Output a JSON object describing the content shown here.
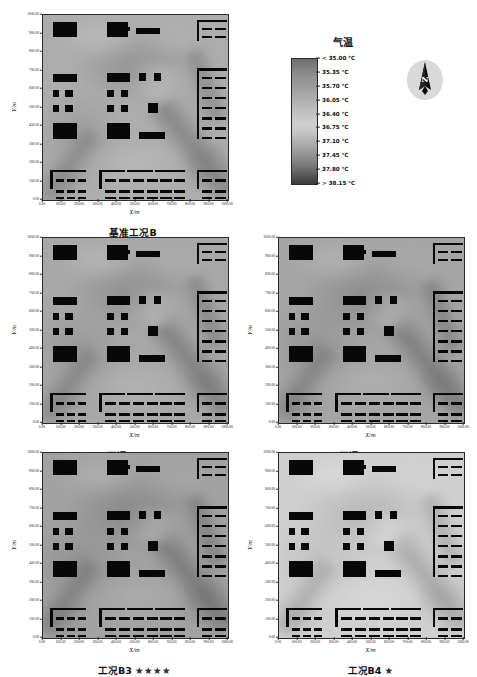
{
  "figure": {
    "axis_x_title": "X/m",
    "axis_y_title": "Y/m",
    "x_ticks": [
      "0.00",
      "100.00",
      "200.00",
      "300.00",
      "400.00",
      "500.00",
      "600.00",
      "700.00",
      "800.00",
      "900.00",
      "1000.00"
    ],
    "y_ticks": [
      "0.00",
      "100.00",
      "200.00",
      "300.00",
      "400.00",
      "500.00",
      "600.00",
      "700.00",
      "800.00",
      "900.00",
      "1000.00"
    ]
  },
  "colorbar": {
    "title": "气温",
    "unit": "℃",
    "labels": [
      "< 35.00 ℃",
      "35.35 ℃",
      "35.70 ℃",
      "36.05 ℃",
      "36.40 ℃",
      "36.75 ℃",
      "37.10 ℃",
      "37.45 ℃",
      "37.80 ℃",
      "> 38.15 ℃"
    ],
    "low_color": "#6e6e6e",
    "high_color": "#3a3a3a",
    "mid_color": "#cfcfcf"
  },
  "north_arrow": {
    "letter": "N"
  },
  "panels": [
    {
      "id": "baseline",
      "caption": "基准工况B",
      "stars": "",
      "star_count": 0
    },
    {
      "id": "b1",
      "caption": "工况B1",
      "stars": "★★",
      "star_count": 2
    },
    {
      "id": "b2",
      "caption": "工况B2",
      "stars": "★★★",
      "star_count": 3
    },
    {
      "id": "b3",
      "caption": "工况B3",
      "stars": "★★★★",
      "star_count": 4
    },
    {
      "id": "b4",
      "caption": "工况B4",
      "stars": "★",
      "star_count": 1
    }
  ],
  "chart_data": {
    "type": "heatmap",
    "title": "",
    "xlabel": "X/m",
    "ylabel": "Y/m",
    "xlim": [
      0,
      1000
    ],
    "ylim": [
      0,
      1000
    ],
    "grid": false,
    "legend_position": "top-right",
    "colorbar": {
      "label": "气温",
      "unit": "℃",
      "tick_values": [
        35.0,
        35.35,
        35.7,
        36.05,
        36.4,
        36.75,
        37.1,
        37.45,
        37.8,
        38.15
      ],
      "tick_labels": [
        "< 35.00 ℃",
        "35.35 ℃",
        "35.70 ℃",
        "36.05 ℃",
        "36.40 ℃",
        "36.75 ℃",
        "37.10 ℃",
        "37.45 ℃",
        "37.80 ℃",
        "> 38.15 ℃"
      ],
      "vmin": 35.0,
      "vmax": 38.15,
      "step": 0.35
    },
    "panels": [
      {
        "name": "基准工况B",
        "stars": 0,
        "mean_temp_estimate": 36.6,
        "position": "row1-left"
      },
      {
        "name": "工况B1",
        "stars": 2,
        "mean_temp_estimate": 36.5,
        "position": "row2-left"
      },
      {
        "name": "工况B2",
        "stars": 3,
        "mean_temp_estimate": 36.4,
        "position": "row2-right"
      },
      {
        "name": "工况B3",
        "stars": 4,
        "mean_temp_estimate": 36.3,
        "position": "row3-left"
      },
      {
        "name": "工况B4",
        "stars": 1,
        "mean_temp_estimate": 37.2,
        "position": "row3-right"
      }
    ]
  }
}
